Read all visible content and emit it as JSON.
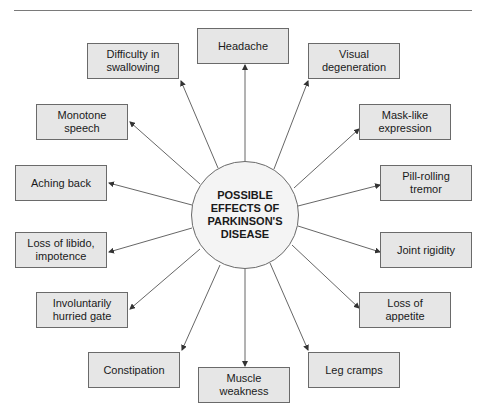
{
  "diagram": {
    "type": "radial-concept-map",
    "center": {
      "label": "POSSIBLE\nEFFECTS OF\nPARKINSON'S\nDISEASE",
      "cx": 245,
      "cy": 215,
      "r": 54
    },
    "colors": {
      "box_fill": "#e6e6e6",
      "box_border": "#6a6a6a",
      "hub_fill": "#f4f4f4",
      "line": "#555555",
      "text": "#1a1a1a"
    },
    "nodes": [
      {
        "id": "headache",
        "label": "Headache",
        "x": 197,
        "y": 28
      },
      {
        "id": "visual",
        "label": "Visual\ndegeneration",
        "x": 308,
        "y": 43
      },
      {
        "id": "mask",
        "label": "Mask-like\nexpression",
        "x": 359,
        "y": 104
      },
      {
        "id": "pill",
        "label": "Pill-rolling\ntremor",
        "x": 380,
        "y": 165
      },
      {
        "id": "joint",
        "label": "Joint rigidity",
        "x": 380,
        "y": 232
      },
      {
        "id": "appetite",
        "label": "Loss of\nappetite",
        "x": 359,
        "y": 292
      },
      {
        "id": "leg",
        "label": "Leg cramps",
        "x": 308,
        "y": 352
      },
      {
        "id": "muscle",
        "label": "Muscle\nweakness",
        "x": 198,
        "y": 367
      },
      {
        "id": "constipation",
        "label": "Constipation",
        "x": 88,
        "y": 352
      },
      {
        "id": "hurried",
        "label": "Involuntarily\nhurried gate",
        "x": 36,
        "y": 292
      },
      {
        "id": "libido",
        "label": "Loss of libido,\nimpotence",
        "x": 15,
        "y": 232
      },
      {
        "id": "aching",
        "label": "Aching back",
        "x": 15,
        "y": 165
      },
      {
        "id": "monotone",
        "label": "Monotone\nspeech",
        "x": 36,
        "y": 104
      },
      {
        "id": "swallowing",
        "label": "Difficulty in\nswallowing",
        "x": 87,
        "y": 43
      }
    ],
    "edges": [
      {
        "x1": 245,
        "y1": 161,
        "x2": 245,
        "y2": 65
      },
      {
        "x1": 274,
        "y1": 169,
        "x2": 308,
        "y2": 81
      },
      {
        "x1": 294,
        "y1": 188,
        "x2": 359,
        "y2": 129
      },
      {
        "x1": 298,
        "y1": 206,
        "x2": 380,
        "y2": 185
      },
      {
        "x1": 298,
        "y1": 226,
        "x2": 380,
        "y2": 252
      },
      {
        "x1": 292,
        "y1": 245,
        "x2": 359,
        "y2": 308
      },
      {
        "x1": 270,
        "y1": 263,
        "x2": 308,
        "y2": 350
      },
      {
        "x1": 245,
        "y1": 269,
        "x2": 245,
        "y2": 366
      },
      {
        "x1": 220,
        "y1": 265,
        "x2": 182,
        "y2": 350
      },
      {
        "x1": 200,
        "y1": 249,
        "x2": 130,
        "y2": 309
      },
      {
        "x1": 192,
        "y1": 228,
        "x2": 109,
        "y2": 252
      },
      {
        "x1": 192,
        "y1": 205,
        "x2": 109,
        "y2": 183
      },
      {
        "x1": 200,
        "y1": 184,
        "x2": 130,
        "y2": 122
      },
      {
        "x1": 218,
        "y1": 168,
        "x2": 181,
        "y2": 81
      }
    ]
  }
}
